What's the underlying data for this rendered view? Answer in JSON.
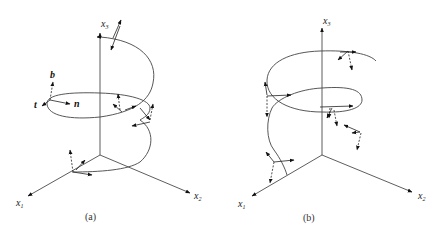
{
  "panels": [
    {
      "id": "a",
      "caption": "(a)",
      "axes": [
        {
          "name": "x1",
          "label": "x",
          "sub": "1"
        },
        {
          "name": "x2",
          "label": "x",
          "sub": "2"
        },
        {
          "name": "x3",
          "label": "x",
          "sub": "3"
        }
      ],
      "frame_labels": {
        "tangent": "t",
        "normal": "n",
        "binormal": "b"
      }
    },
    {
      "id": "b",
      "caption": "(b)",
      "axes": [
        {
          "name": "x1",
          "label": "x",
          "sub": "1"
        },
        {
          "name": "x2",
          "label": "x",
          "sub": "2"
        },
        {
          "name": "x3",
          "label": "x",
          "sub": "3"
        }
      ]
    }
  ]
}
